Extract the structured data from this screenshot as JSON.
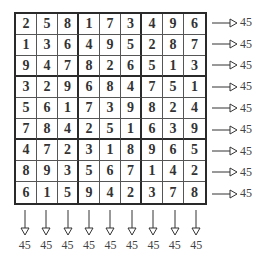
{
  "grid": [
    [
      2,
      5,
      8,
      1,
      7,
      3,
      4,
      9,
      6
    ],
    [
      1,
      3,
      6,
      4,
      9,
      5,
      2,
      8,
      7
    ],
    [
      9,
      4,
      7,
      8,
      2,
      6,
      5,
      1,
      3
    ],
    [
      3,
      2,
      9,
      6,
      8,
      4,
      7,
      5,
      1
    ],
    [
      5,
      6,
      1,
      7,
      3,
      9,
      8,
      2,
      4
    ],
    [
      7,
      8,
      4,
      2,
      5,
      1,
      6,
      3,
      9
    ],
    [
      4,
      7,
      2,
      3,
      1,
      8,
      9,
      6,
      5
    ],
    [
      8,
      9,
      3,
      5,
      6,
      7,
      1,
      4,
      2
    ],
    [
      6,
      1,
      5,
      9,
      4,
      2,
      3,
      7,
      8
    ]
  ],
  "row_sums": [
    "45",
    "45",
    "45",
    "45",
    "45",
    "45",
    "45",
    "45",
    "45"
  ],
  "col_sums": [
    "45",
    "45",
    "45",
    "45",
    "45",
    "45",
    "45",
    "45",
    "45"
  ],
  "colors": {
    "line": "#2a2a2a",
    "text": "#333333"
  }
}
